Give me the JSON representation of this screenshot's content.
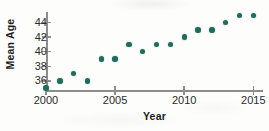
{
  "figure": {
    "name": "mean-age-scatterplot",
    "marker_color": "#1f6b5c",
    "axis_color": "#8d8d8d",
    "background": "#fdfdfc"
  },
  "chart_data": {
    "type": "scatter",
    "title": "",
    "xlabel": "Year",
    "ylabel": "Mean Age",
    "xlim": [
      2000,
      2015.7
    ],
    "ylim": [
      34.6,
      45.6
    ],
    "grid": false,
    "legend": null,
    "xticks": [
      2000,
      2005,
      2010,
      2015
    ],
    "xticklabels": [
      "2000",
      "2005",
      "2010",
      "2015"
    ],
    "yticks": [
      36,
      38,
      40,
      42,
      44
    ],
    "yticklabels": [
      "36",
      "38",
      "40",
      "42",
      "44"
    ],
    "x": [
      2000,
      2001,
      2002,
      2003,
      2004,
      2005,
      2006,
      2007,
      2008,
      2009,
      2010,
      2011,
      2012,
      2013,
      2014,
      2015
    ],
    "y": [
      35,
      36,
      37,
      36,
      39,
      39,
      41,
      40,
      41,
      41,
      42,
      43,
      43,
      44,
      45,
      45
    ],
    "points": [
      {
        "label": "2000",
        "x": 2000,
        "y": 35
      },
      {
        "label": "2001",
        "x": 2001,
        "y": 36
      },
      {
        "label": "2002",
        "x": 2002,
        "y": 37
      },
      {
        "label": "2003",
        "x": 2003,
        "y": 36
      },
      {
        "label": "2004",
        "x": 2004,
        "y": 39
      },
      {
        "label": "2005",
        "x": 2005,
        "y": 39
      },
      {
        "label": "2006",
        "x": 2006,
        "y": 41
      },
      {
        "label": "2007",
        "x": 2007,
        "y": 40
      },
      {
        "label": "2008",
        "x": 2008,
        "y": 41
      },
      {
        "label": "2009",
        "x": 2009,
        "y": 41
      },
      {
        "label": "2010",
        "x": 2010,
        "y": 42
      },
      {
        "label": "2011",
        "x": 2011,
        "y": 43
      },
      {
        "label": "2012",
        "x": 2012,
        "y": 43
      },
      {
        "label": "2013",
        "x": 2013,
        "y": 44
      },
      {
        "label": "2014",
        "x": 2014,
        "y": 45
      },
      {
        "label": "2015",
        "x": 2015,
        "y": 45
      }
    ]
  }
}
